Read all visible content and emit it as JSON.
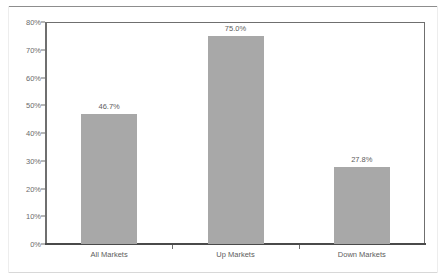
{
  "chart_data": {
    "type": "bar",
    "title": "",
    "subtitle": "",
    "xlabel": "",
    "ylabel": "",
    "categories": [
      "All Markets",
      "Up Markets",
      "Down Markets"
    ],
    "values": [
      46.7,
      75.0,
      27.8
    ],
    "value_labels": [
      "46.7%",
      "75.0%",
      "27.8%"
    ],
    "ylim": [
      0,
      80
    ],
    "ytick_values": [
      80,
      70,
      60,
      50,
      40,
      30,
      20,
      10,
      0
    ],
    "ytick_labels": [
      "80%",
      "70%",
      "60%",
      "50%",
      "40%",
      "30%",
      "20%",
      "10%",
      "0%"
    ],
    "grid": false,
    "legend": null,
    "legend_position": "none",
    "bar_color": "#a8a8a8",
    "axis_color": "#6f6f6f",
    "text_color": "#5d5d5d",
    "background": "#ffffff"
  }
}
